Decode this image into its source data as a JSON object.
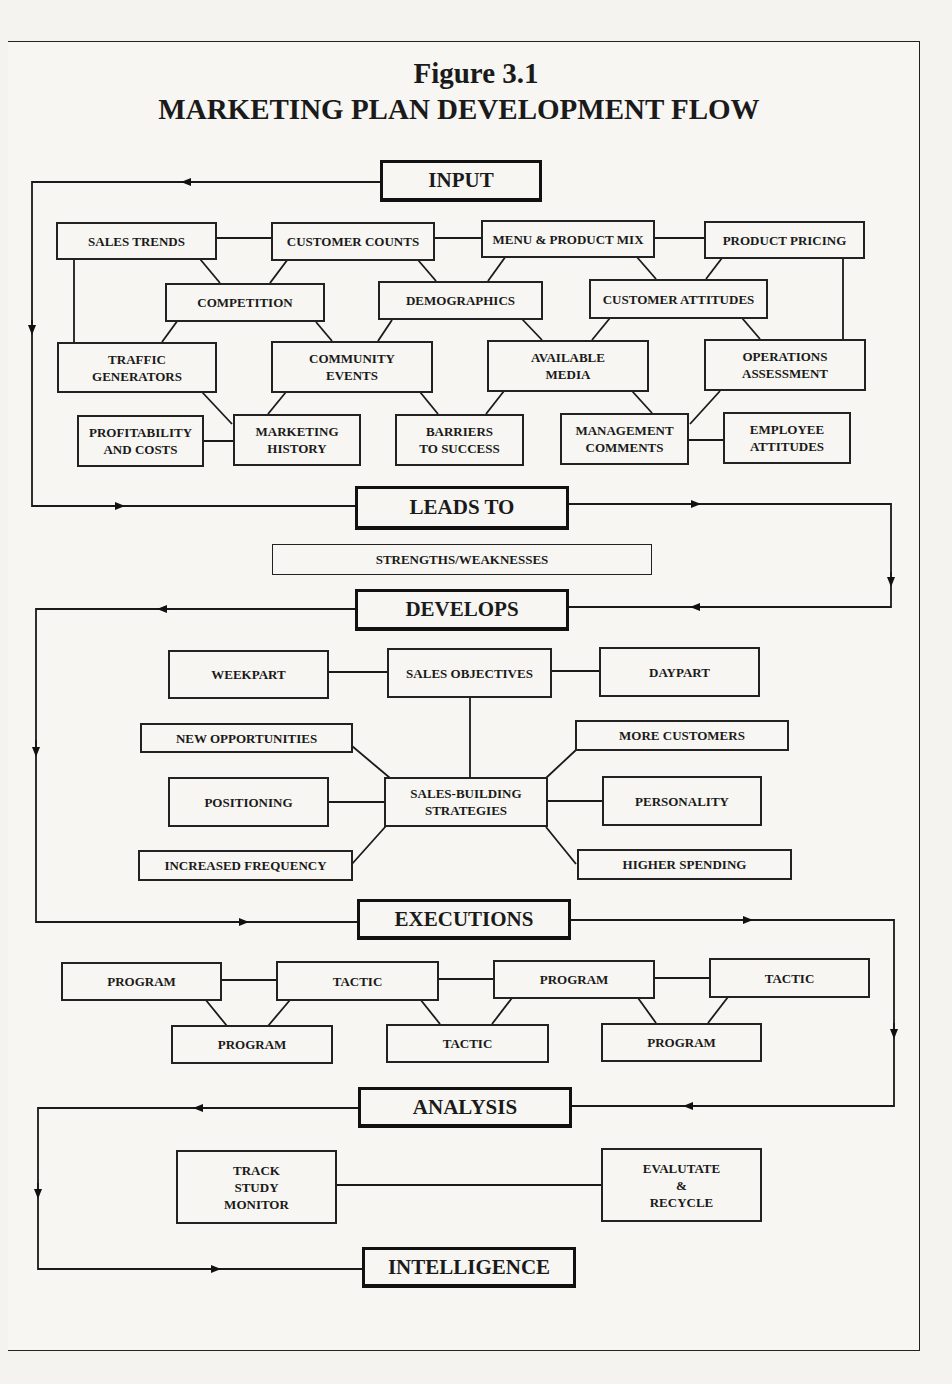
{
  "title": {
    "figure": "Figure 3.1",
    "heading": "MARKETING PLAN DEVELOPMENT FLOW"
  },
  "stages": {
    "input": "INPUT",
    "leads_to": "LEADS TO",
    "develops": "DEVELOPS",
    "executions": "EXECUTIONS",
    "analysis": "ANALYSIS",
    "intelligence": "INTELLIGENCE"
  },
  "input_factors": {
    "sales_trends": "SALES TRENDS",
    "customer_counts": "CUSTOMER COUNTS",
    "menu_product_mix": "MENU & PRODUCT MIX",
    "product_pricing": "PRODUCT PRICING",
    "competition": "COMPETITION",
    "demographics": "DEMOGRAPHICS",
    "customer_attitudes": "CUSTOMER ATTITUDES",
    "traffic_generators": "TRAFFIC\nGENERATORS",
    "community_events": "COMMUNITY\nEVENTS",
    "available_media": "AVAILABLE\nMEDIA",
    "operations_assessment": "OPERATIONS\nASSESSMENT",
    "profitability_costs": "PROFITABILITY\nAND COSTS",
    "marketing_history": "MARKETING\nHISTORY",
    "barriers_to_success": "BARRIERS\nTO SUCCESS",
    "management_comments": "MANAGEMENT\nCOMMENTS",
    "employee_attitudes": "EMPLOYEE\nATTITUDES"
  },
  "leads_to_result": "STRENGTHS/WEAKNESSES",
  "develops_items": {
    "weekpart": "WEEKPART",
    "sales_objectives": "SALES OBJECTIVES",
    "daypart": "DAYPART",
    "new_opportunities": "NEW OPPORTUNITIES",
    "more_customers": "MORE CUSTOMERS",
    "positioning": "POSITIONING",
    "sales_building_strategies": "SALES-BUILDING\nSTRATEGIES",
    "personality": "PERSONALITY",
    "increased_frequency": "INCREASED FREQUENCY",
    "higher_spending": "HIGHER SPENDING"
  },
  "executions_items": {
    "top": [
      "PROGRAM",
      "TACTIC",
      "PROGRAM",
      "TACTIC"
    ],
    "bottom": [
      "PROGRAM",
      "TACTIC",
      "PROGRAM"
    ]
  },
  "analysis_items": {
    "track": "TRACK\nSTUDY\nMONITOR",
    "evaluate": "EVALUTATE\n&\nRECYCLE"
  },
  "colors": {
    "ink": "#1a1a1a",
    "paper": "#f7f6f2"
  }
}
